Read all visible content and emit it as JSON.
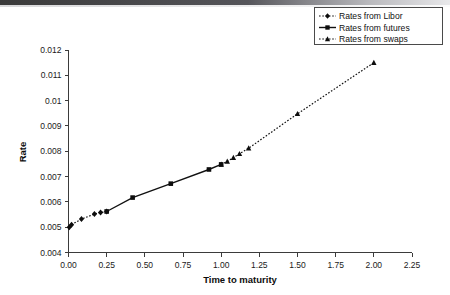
{
  "figure": {
    "background_color": "#ffffff",
    "foreground_color": "#111111",
    "scan_artifact": true
  },
  "chart_data": {
    "type": "line",
    "title": "",
    "xlabel": "Time to maturity",
    "ylabel": "Rate",
    "xlim": [
      0.0,
      2.25
    ],
    "ylim": [
      0.004,
      0.012
    ],
    "xticks": [
      0.0,
      0.25,
      0.5,
      0.75,
      1.0,
      1.25,
      1.5,
      1.75,
      2.0,
      2.25
    ],
    "xtick_labels": [
      "0.00",
      "0.25",
      "0.50",
      "0.75",
      "1.00",
      "1.25",
      "1.50",
      "1.75",
      "2.00",
      "2.25"
    ],
    "yticks": [
      0.004,
      0.005,
      0.006,
      0.007,
      0.008,
      0.009,
      0.01,
      0.011,
      0.012
    ],
    "ytick_labels": [
      "0.004",
      "0.005",
      "0.006",
      "0.007",
      "0.008",
      "0.009",
      "0.01",
      "0.011",
      "0.012"
    ],
    "grid": false,
    "legend_position": "top-right",
    "series": [
      {
        "name": "Rates from Libor",
        "linestyle": "dotted",
        "marker": "diamond",
        "color": "#111111",
        "points": [
          {
            "x": 0.005,
            "y": 0.005
          },
          {
            "x": 0.02,
            "y": 0.0051
          },
          {
            "x": 0.085,
            "y": 0.00532
          },
          {
            "x": 0.17,
            "y": 0.00552
          },
          {
            "x": 0.21,
            "y": 0.00558
          },
          {
            "x": 0.25,
            "y": 0.00562
          }
        ]
      },
      {
        "name": "Rates from futures",
        "linestyle": "solid",
        "marker": "square",
        "color": "#111111",
        "points": [
          {
            "x": 0.25,
            "y": 0.00562
          },
          {
            "x": 0.42,
            "y": 0.00617
          },
          {
            "x": 0.67,
            "y": 0.00672
          },
          {
            "x": 0.92,
            "y": 0.00728
          },
          {
            "x": 1.0,
            "y": 0.00748
          }
        ]
      },
      {
        "name": "Rates from swaps",
        "linestyle": "dotted",
        "marker": "triangle",
        "color": "#111111",
        "points": [
          {
            "x": 1.0,
            "y": 0.00748
          },
          {
            "x": 1.04,
            "y": 0.0076
          },
          {
            "x": 1.08,
            "y": 0.00775
          },
          {
            "x": 1.12,
            "y": 0.0079
          },
          {
            "x": 1.18,
            "y": 0.00812
          },
          {
            "x": 1.5,
            "y": 0.00948
          },
          {
            "x": 2.0,
            "y": 0.0115
          }
        ]
      }
    ]
  },
  "legend": {
    "entries": [
      {
        "label": "Rates from Libor",
        "style": "dotted",
        "marker": "diamond"
      },
      {
        "label": "Rates from futures",
        "style": "solid",
        "marker": "square"
      },
      {
        "label": "Rates from swaps",
        "style": "dotted",
        "marker": "triangle"
      }
    ]
  }
}
